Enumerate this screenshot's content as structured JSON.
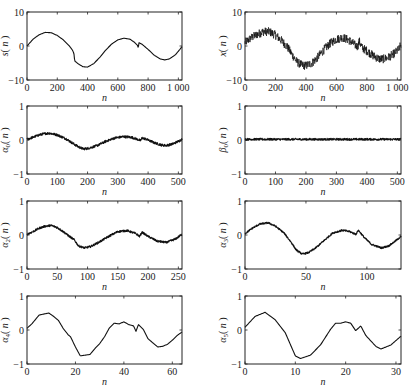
{
  "chart_data": [
    {
      "id": "s",
      "type": "line",
      "ylabel": "s(n)",
      "ylabel_main": "s",
      "ylabel_sub": "",
      "xlabel": "n",
      "xlim": [
        0,
        1024
      ],
      "ylim": [
        -10,
        10
      ],
      "xticks": [
        0,
        200,
        400,
        600,
        800,
        1000
      ],
      "xtick_labels": [
        "0",
        "200",
        "400",
        "600",
        "800",
        "1 000"
      ],
      "yticks": [
        -10,
        0,
        10
      ],
      "ytick_labels": [
        "−10",
        "0",
        "10"
      ],
      "noise": 0.0,
      "points": [
        [
          0,
          0
        ],
        [
          40,
          2
        ],
        [
          80,
          3.3
        ],
        [
          120,
          4
        ],
        [
          160,
          3.9
        ],
        [
          200,
          3.1
        ],
        [
          240,
          1.8
        ],
        [
          280,
          0
        ],
        [
          300,
          -1.2
        ],
        [
          310,
          -2.2
        ],
        [
          315,
          -4.4
        ],
        [
          340,
          -5.3
        ],
        [
          370,
          -6.1
        ],
        [
          400,
          -6.2
        ],
        [
          440,
          -5.2
        ],
        [
          480,
          -3.4
        ],
        [
          520,
          -1.2
        ],
        [
          560,
          0.6
        ],
        [
          600,
          1.8
        ],
        [
          640,
          2.3
        ],
        [
          680,
          2
        ],
        [
          710,
          1.1
        ],
        [
          730,
          0.2
        ],
        [
          735,
          -0.6
        ],
        [
          740,
          1
        ],
        [
          760,
          0.5
        ],
        [
          800,
          -1
        ],
        [
          840,
          -2.7
        ],
        [
          880,
          -3.8
        ],
        [
          910,
          -4.1
        ],
        [
          940,
          -3.8
        ],
        [
          980,
          -2.6
        ],
        [
          1010,
          -1
        ],
        [
          1024,
          -0.2
        ]
      ]
    },
    {
      "id": "x",
      "type": "line",
      "ylabel": "x(n)",
      "ylabel_main": "x",
      "ylabel_sub": "",
      "xlabel": "n",
      "xlim": [
        0,
        1024
      ],
      "ylim": [
        -10,
        10
      ],
      "xticks": [
        0,
        200,
        400,
        600,
        800,
        1000
      ],
      "xtick_labels": [
        "0",
        "200",
        "400",
        "600",
        "800",
        "1 000"
      ],
      "yticks": [
        -10,
        0,
        10
      ],
      "ytick_labels": [
        "−10",
        "0",
        "10"
      ],
      "noise": 1.3,
      "points": [
        [
          0,
          1
        ],
        [
          40,
          2.4
        ],
        [
          80,
          3.4
        ],
        [
          120,
          4.2
        ],
        [
          160,
          4.2
        ],
        [
          200,
          3.2
        ],
        [
          240,
          1.6
        ],
        [
          280,
          -0.4
        ],
        [
          310,
          -2.6
        ],
        [
          340,
          -4.6
        ],
        [
          370,
          -5.6
        ],
        [
          400,
          -5.8
        ],
        [
          440,
          -5
        ],
        [
          480,
          -3.2
        ],
        [
          520,
          -1
        ],
        [
          560,
          0.8
        ],
        [
          600,
          2
        ],
        [
          640,
          2.5
        ],
        [
          680,
          1.8
        ],
        [
          720,
          0.4
        ],
        [
          740,
          -0.2
        ],
        [
          750,
          1.4
        ],
        [
          770,
          -0.6
        ],
        [
          800,
          -1.4
        ],
        [
          840,
          -2.8
        ],
        [
          880,
          -3.8
        ],
        [
          910,
          -3.8
        ],
        [
          940,
          -3.4
        ],
        [
          980,
          -2.2
        ],
        [
          1010,
          -1
        ],
        [
          1024,
          0.4
        ]
      ]
    },
    {
      "id": "alpha0",
      "type": "line",
      "ylabel": "α0(n)",
      "ylabel_main": "α",
      "ylabel_sub": "0",
      "xlabel": "n",
      "xlim": [
        0,
        512
      ],
      "ylim": [
        -1,
        1
      ],
      "xticks": [
        0,
        100,
        200,
        300,
        400,
        500
      ],
      "xtick_labels": [
        "0",
        "100",
        "200",
        "300",
        "400",
        "500"
      ],
      "yticks": [
        -1,
        0,
        1
      ],
      "ytick_labels": [
        "−1",
        "0",
        "1"
      ],
      "noise": 0.035,
      "points": [
        [
          0,
          0.02
        ],
        [
          20,
          0.08
        ],
        [
          40,
          0.15
        ],
        [
          60,
          0.19
        ],
        [
          75,
          0.2
        ],
        [
          100,
          0.15
        ],
        [
          130,
          0.03
        ],
        [
          155,
          -0.12
        ],
        [
          170,
          -0.2
        ],
        [
          185,
          -0.26
        ],
        [
          200,
          -0.25
        ],
        [
          230,
          -0.17
        ],
        [
          260,
          -0.04
        ],
        [
          290,
          0.06
        ],
        [
          320,
          0.1
        ],
        [
          345,
          0.08
        ],
        [
          365,
          0.02
        ],
        [
          375,
          -0.02
        ],
        [
          380,
          0.06
        ],
        [
          395,
          0.02
        ],
        [
          420,
          -0.08
        ],
        [
          445,
          -0.15
        ],
        [
          460,
          -0.16
        ],
        [
          480,
          -0.12
        ],
        [
          500,
          -0.04
        ],
        [
          512,
          0.02
        ]
      ]
    },
    {
      "id": "beta0",
      "type": "line",
      "ylabel": "β0(n)",
      "ylabel_main": "β",
      "ylabel_sub": "0",
      "xlabel": "n",
      "xlim": [
        0,
        512
      ],
      "ylim": [
        -1,
        1
      ],
      "xticks": [
        0,
        100,
        200,
        300,
        400,
        500
      ],
      "xtick_labels": [
        "0",
        "100",
        "200",
        "300",
        "400",
        "500"
      ],
      "yticks": [
        -1,
        0,
        1
      ],
      "ytick_labels": [
        "−1",
        "0",
        "1"
      ],
      "noise": 0.03,
      "points": [
        [
          0,
          0.02
        ],
        [
          512,
          0.02
        ]
      ]
    },
    {
      "id": "alpha2",
      "type": "line",
      "ylabel": "α2(n)",
      "ylabel_main": "α",
      "ylabel_sub": "2",
      "xlabel": "n",
      "xlim": [
        0,
        256
      ],
      "ylim": [
        -1,
        1
      ],
      "xticks": [
        0,
        50,
        100,
        150,
        200,
        250
      ],
      "xtick_labels": [
        "0",
        "50",
        "100",
        "150",
        "200",
        "250"
      ],
      "yticks": [
        -1,
        0,
        1
      ],
      "ytick_labels": [
        "−1",
        "0",
        "1"
      ],
      "noise": 0.03,
      "points": [
        [
          0,
          0.02
        ],
        [
          10,
          0.1
        ],
        [
          20,
          0.2
        ],
        [
          30,
          0.26
        ],
        [
          40,
          0.28
        ],
        [
          50,
          0.22
        ],
        [
          60,
          0.1
        ],
        [
          70,
          -0.04
        ],
        [
          78,
          -0.14
        ],
        [
          85,
          -0.32
        ],
        [
          95,
          -0.38
        ],
        [
          105,
          -0.34
        ],
        [
          120,
          -0.2
        ],
        [
          135,
          -0.04
        ],
        [
          150,
          0.1
        ],
        [
          165,
          0.13
        ],
        [
          180,
          0.04
        ],
        [
          186,
          -0.04
        ],
        [
          190,
          0.08
        ],
        [
          200,
          -0.04
        ],
        [
          215,
          -0.18
        ],
        [
          230,
          -0.22
        ],
        [
          245,
          -0.12
        ],
        [
          256,
          0.02
        ]
      ]
    },
    {
      "id": "alpha3",
      "type": "line",
      "ylabel": "α3(n)",
      "ylabel_main": "α",
      "ylabel_sub": "3",
      "xlabel": "n",
      "xlim": [
        0,
        128
      ],
      "ylim": [
        -1,
        1
      ],
      "xticks": [
        0,
        50,
        100
      ],
      "xtick_labels": [
        "0",
        "50",
        "100"
      ],
      "yticks": [
        -1,
        0,
        1
      ],
      "ytick_labels": [
        "−1",
        "0",
        "1"
      ],
      "noise": 0.025,
      "points": [
        [
          0,
          0.04
        ],
        [
          6,
          0.2
        ],
        [
          12,
          0.32
        ],
        [
          19,
          0.36
        ],
        [
          25,
          0.26
        ],
        [
          32,
          0.06
        ],
        [
          38,
          -0.22
        ],
        [
          42,
          -0.44
        ],
        [
          47,
          -0.56
        ],
        [
          52,
          -0.52
        ],
        [
          58,
          -0.38
        ],
        [
          65,
          -0.16
        ],
        [
          72,
          0.06
        ],
        [
          80,
          0.14
        ],
        [
          86,
          0.1
        ],
        [
          91,
          0.02
        ],
        [
          93,
          0.14
        ],
        [
          98,
          -0.08
        ],
        [
          104,
          -0.28
        ],
        [
          112,
          -0.38
        ],
        [
          118,
          -0.32
        ],
        [
          124,
          -0.16
        ],
        [
          128,
          -0.04
        ]
      ]
    },
    {
      "id": "alpha4",
      "type": "line",
      "ylabel": "α4(n)",
      "ylabel_main": "α",
      "ylabel_sub": "4",
      "xlabel": "n",
      "xlim": [
        0,
        64
      ],
      "ylim": [
        -1,
        1
      ],
      "xticks": [
        0,
        20,
        40,
        60
      ],
      "xtick_labels": [
        "0",
        "20",
        "40",
        "60"
      ],
      "yticks": [
        -1,
        0,
        1
      ],
      "ytick_labels": [
        "−1",
        "0",
        "1"
      ],
      "noise": 0.0,
      "points": [
        [
          0,
          0.05
        ],
        [
          2,
          0.18
        ],
        [
          5,
          0.44
        ],
        [
          7,
          0.47
        ],
        [
          9,
          0.5
        ],
        [
          11,
          0.4
        ],
        [
          13,
          0.28
        ],
        [
          15,
          0.04
        ],
        [
          17,
          -0.14
        ],
        [
          18,
          -0.2
        ],
        [
          20,
          -0.5
        ],
        [
          22,
          -0.76
        ],
        [
          24,
          -0.74
        ],
        [
          26,
          -0.72
        ],
        [
          28,
          -0.55
        ],
        [
          30,
          -0.4
        ],
        [
          32,
          -0.2
        ],
        [
          34,
          0.06
        ],
        [
          36,
          0.2
        ],
        [
          38,
          0.18
        ],
        [
          40,
          0.24
        ],
        [
          42,
          0.16
        ],
        [
          44,
          0.12
        ],
        [
          45,
          -0.04
        ],
        [
          46,
          0.16
        ],
        [
          48,
          0.02
        ],
        [
          50,
          -0.26
        ],
        [
          52,
          -0.38
        ],
        [
          54,
          -0.5
        ],
        [
          56,
          -0.48
        ],
        [
          58,
          -0.42
        ],
        [
          60,
          -0.3
        ],
        [
          62,
          -0.16
        ],
        [
          64,
          -0.06
        ]
      ]
    },
    {
      "id": "alpha5",
      "type": "line",
      "ylabel": "α5(n)",
      "ylabel_main": "α",
      "ylabel_sub": "5",
      "xlabel": "n",
      "xlim": [
        0,
        31
      ],
      "ylim": [
        -1,
        1
      ],
      "xticks": [
        0,
        10,
        20,
        30
      ],
      "xtick_labels": [
        "0",
        "10",
        "20",
        "30"
      ],
      "yticks": [
        -1,
        0,
        1
      ],
      "ytick_labels": [
        "−1",
        "0",
        "1"
      ],
      "noise": 0.0,
      "points": [
        [
          0,
          0.08
        ],
        [
          2,
          0.4
        ],
        [
          4,
          0.52
        ],
        [
          6,
          0.3
        ],
        [
          8,
          -0.08
        ],
        [
          10,
          -0.76
        ],
        [
          11,
          -0.84
        ],
        [
          13,
          -0.74
        ],
        [
          15,
          -0.44
        ],
        [
          17,
          0.02
        ],
        [
          18,
          0.2
        ],
        [
          19,
          0.2
        ],
        [
          20,
          0.24
        ],
        [
          21,
          0.2
        ],
        [
          22,
          -0.02
        ],
        [
          23,
          0.12
        ],
        [
          24,
          -0.16
        ],
        [
          26,
          -0.48
        ],
        [
          27,
          -0.56
        ],
        [
          29,
          -0.44
        ],
        [
          31,
          -0.18
        ]
      ]
    }
  ],
  "layout": {
    "panels": [
      {
        "chart": 0,
        "x": 27,
        "y": 12,
        "w": 155,
        "h": 68
      },
      {
        "chart": 1,
        "x": 245,
        "y": 12,
        "w": 156,
        "h": 68
      },
      {
        "chart": 2,
        "x": 27,
        "y": 106,
        "w": 155,
        "h": 68
      },
      {
        "chart": 3,
        "x": 245,
        "y": 106,
        "w": 156,
        "h": 68
      },
      {
        "chart": 4,
        "x": 27,
        "y": 201,
        "w": 155,
        "h": 68
      },
      {
        "chart": 5,
        "x": 245,
        "y": 201,
        "w": 156,
        "h": 68
      },
      {
        "chart": 6,
        "x": 27,
        "y": 296,
        "w": 155,
        "h": 68
      },
      {
        "chart": 7,
        "x": 245,
        "y": 296,
        "w": 156,
        "h": 68
      }
    ]
  }
}
